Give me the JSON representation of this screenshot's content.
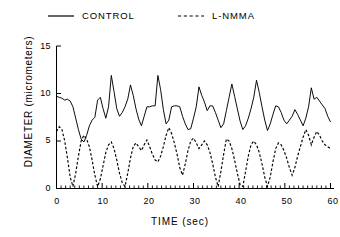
{
  "legend": {
    "position": "top",
    "entries": [
      {
        "label": "CONTROL",
        "style": "solid",
        "icon": "solid-line-icon"
      },
      {
        "label": "L-NMMA",
        "style": "dashed",
        "icon": "dashed-line-icon"
      }
    ]
  },
  "axes": {
    "x": {
      "label": "TIME  (sec)",
      "ticks": [
        "0",
        "10",
        "20",
        "30",
        "40",
        "50",
        "60"
      ],
      "minor_tick_interval": 1
    },
    "y": {
      "label": "DIAMETER  (micrometers)",
      "ticks": [
        "0",
        "5",
        "10",
        "15"
      ]
    }
  },
  "chart_data": {
    "type": "line",
    "title": "",
    "xlabel": "TIME (sec)",
    "ylabel": "DIAMETER (micrometers)",
    "xlim": [
      0,
      60
    ],
    "ylim": [
      0,
      15
    ],
    "xticks": [
      0,
      10,
      20,
      30,
      40,
      50,
      60
    ],
    "yticks": [
      0,
      5,
      10,
      15
    ],
    "grid": false,
    "legend_position": "above-axes",
    "series": [
      {
        "name": "CONTROL",
        "style": "solid",
        "color": "#000000",
        "x": [
          0,
          0.6,
          1.2,
          1.8,
          2.4,
          3.0,
          3.6,
          4.2,
          4.8,
          5.4,
          6.0,
          6.6,
          7.2,
          7.8,
          8.4,
          9.0,
          9.6,
          10.2,
          10.8,
          11.4,
          12.0,
          12.6,
          13.2,
          13.8,
          14.4,
          15.0,
          15.6,
          16.2,
          16.8,
          17.4,
          18.0,
          18.6,
          19.2,
          19.8,
          20.4,
          21.0,
          21.6,
          22.2,
          22.8,
          23.4,
          24.0,
          24.6,
          25.2,
          25.8,
          26.4,
          27.0,
          27.6,
          28.2,
          28.8,
          29.4,
          30.0,
          30.6,
          31.2,
          31.8,
          32.4,
          33.0,
          33.6,
          34.2,
          34.8,
          35.4,
          36.0,
          36.6,
          37.2,
          37.8,
          38.4,
          39.0,
          39.6,
          40.2,
          40.8,
          41.4,
          42.0,
          42.6,
          43.2,
          43.8,
          44.4,
          45.0,
          45.6,
          46.2,
          46.8,
          47.4,
          48.0,
          48.6,
          49.2,
          49.8,
          50.4,
          51.0,
          51.6,
          52.2,
          52.8,
          53.4,
          54.0,
          54.6,
          55.2,
          55.8,
          56.4,
          57.0,
          57.6,
          58.2,
          58.8,
          59.4,
          60.0
        ],
        "y": [
          9.7,
          9.6,
          9.5,
          9.3,
          9.4,
          9.2,
          8.6,
          7.4,
          6.2,
          5.2,
          4.9,
          5.6,
          6.6,
          7.2,
          7.5,
          9.3,
          9.6,
          8.4,
          7.4,
          8.6,
          11.9,
          10.2,
          8.4,
          7.6,
          8.0,
          8.6,
          9.4,
          10.9,
          9.8,
          8.4,
          7.3,
          6.6,
          7.6,
          8.6,
          8.6,
          8.7,
          8.7,
          11.9,
          10.4,
          8.3,
          6.8,
          7.2,
          8.6,
          8.7,
          8.7,
          8.6,
          7.6,
          6.8,
          6.2,
          6.3,
          7.4,
          8.6,
          10.7,
          9.8,
          9.1,
          8.2,
          8.7,
          8.7,
          8.0,
          7.2,
          6.4,
          6.8,
          8.2,
          9.6,
          11.0,
          9.7,
          8.4,
          7.1,
          6.2,
          6.6,
          7.4,
          8.4,
          9.6,
          11.4,
          10.1,
          8.6,
          7.2,
          6.1,
          6.8,
          7.8,
          8.7,
          8.6,
          8.0,
          7.2,
          6.8,
          7.2,
          7.6,
          8.3,
          7.8,
          7.2,
          6.6,
          7.4,
          8.6,
          10.6,
          9.4,
          9.6,
          9.2,
          8.8,
          8.4,
          7.6,
          7.0
        ]
      },
      {
        "name": "L-NMMA",
        "style": "dashed",
        "color": "#000000",
        "x": [
          0,
          0.6,
          1.2,
          1.8,
          2.4,
          3.0,
          3.6,
          4.2,
          4.8,
          5.4,
          6.0,
          6.6,
          7.2,
          7.8,
          8.4,
          9.0,
          9.6,
          10.2,
          10.8,
          11.4,
          12.0,
          12.6,
          13.2,
          13.8,
          14.4,
          15.0,
          15.6,
          16.2,
          16.8,
          17.4,
          18.0,
          18.6,
          19.2,
          19.8,
          20.4,
          21.0,
          21.6,
          22.2,
          22.8,
          23.4,
          24.0,
          24.6,
          25.2,
          25.8,
          26.4,
          27.0,
          27.6,
          28.2,
          28.8,
          29.4,
          30.0,
          30.6,
          31.2,
          31.8,
          32.4,
          33.0,
          33.6,
          34.2,
          34.8,
          35.4,
          36.0,
          36.6,
          37.2,
          37.8,
          38.4,
          39.0,
          39.6,
          40.2,
          40.8,
          41.4,
          42.0,
          42.6,
          43.2,
          43.8,
          44.4,
          45.0,
          45.6,
          46.2,
          46.8,
          47.4,
          48.0,
          48.6,
          49.2,
          49.8,
          50.4,
          51.0,
          51.6,
          52.2,
          52.8,
          53.4,
          54.0,
          54.6,
          55.2,
          55.8,
          56.4,
          57.0,
          57.6,
          58.2,
          58.8,
          59.4,
          60.0
        ],
        "y": [
          6.0,
          6.5,
          6.2,
          5.0,
          3.2,
          1.2,
          0.2,
          1.6,
          3.4,
          5.0,
          5.6,
          5.2,
          4.4,
          3.0,
          1.4,
          0.2,
          1.0,
          2.4,
          3.8,
          4.6,
          4.9,
          4.2,
          3.0,
          1.6,
          0.6,
          0.2,
          1.6,
          3.2,
          4.4,
          4.8,
          4.4,
          4.0,
          4.6,
          5.1,
          4.4,
          3.6,
          3.0,
          2.8,
          3.4,
          4.4,
          5.6,
          6.4,
          5.8,
          4.8,
          3.6,
          2.2,
          1.4,
          2.6,
          4.0,
          5.0,
          5.3,
          4.8,
          4.2,
          4.6,
          5.0,
          4.6,
          3.8,
          2.6,
          1.2,
          0.2,
          1.8,
          3.6,
          5.2,
          5.0,
          4.2,
          3.0,
          1.6,
          0.4,
          0.2,
          1.8,
          3.4,
          4.6,
          5.0,
          4.6,
          3.8,
          2.6,
          1.2,
          0.2,
          1.2,
          2.8,
          4.2,
          4.8,
          4.6,
          4.0,
          3.2,
          2.2,
          1.4,
          2.2,
          3.4,
          4.4,
          5.4,
          6.2,
          5.6,
          4.6,
          5.4,
          6.0,
          5.6,
          5.0,
          4.6,
          4.4,
          4.2
        ]
      }
    ]
  }
}
